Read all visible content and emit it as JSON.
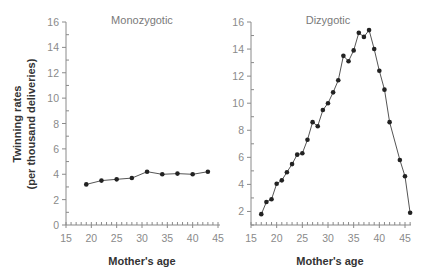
{
  "chart_data": [
    {
      "type": "line",
      "title": "Monozygotic",
      "xlabel": "Mother's age",
      "ylabel": "Twinning rates (per thousand deliveries)",
      "xlim": [
        15,
        45
      ],
      "ylim": [
        0,
        16
      ],
      "xticks": [
        15,
        20,
        25,
        30,
        35,
        40,
        45
      ],
      "yticks": [
        0,
        2,
        4,
        6,
        8,
        10,
        12,
        14,
        16
      ],
      "grid": false,
      "x": [
        19,
        22,
        25,
        28,
        31,
        34,
        37,
        40,
        43
      ],
      "values": [
        3.2,
        3.5,
        3.6,
        3.7,
        4.2,
        4.0,
        4.05,
        4.0,
        4.2
      ]
    },
    {
      "type": "line",
      "title": "Dizygotic",
      "xlabel": "Mother's age",
      "ylabel": "",
      "xlim": [
        15,
        46
      ],
      "ylim": [
        1,
        16
      ],
      "xticks": [
        15,
        20,
        25,
        30,
        35,
        40,
        45
      ],
      "yticks": [
        2,
        4,
        6,
        8,
        10,
        12,
        14,
        16
      ],
      "grid": false,
      "x": [
        17,
        18,
        19,
        20,
        21,
        22,
        23,
        24,
        25,
        26,
        27,
        28,
        29,
        30,
        31,
        32,
        33,
        34,
        35,
        36,
        37,
        38,
        39,
        40,
        41,
        42,
        44,
        45,
        46
      ],
      "values": [
        1.8,
        2.7,
        2.9,
        4.05,
        4.3,
        4.9,
        5.5,
        6.2,
        6.3,
        7.3,
        8.6,
        8.3,
        9.5,
        10.0,
        10.8,
        11.7,
        13.5,
        13.1,
        13.9,
        15.2,
        14.9,
        15.4,
        14.0,
        12.4,
        11.0,
        8.6,
        5.8,
        4.6,
        1.9
      ]
    }
  ],
  "labels": {
    "ylabel_line1": "Twinning rates",
    "ylabel_line2": "(per thousand deliveries)",
    "left_title": "Monozygotic",
    "right_title": "Dizygotic",
    "left_xlabel": "Mother's age",
    "right_xlabel": "Mother's age"
  },
  "colors": {
    "line": "#555555",
    "marker": "#222222",
    "axis": "#8a8a8a"
  }
}
